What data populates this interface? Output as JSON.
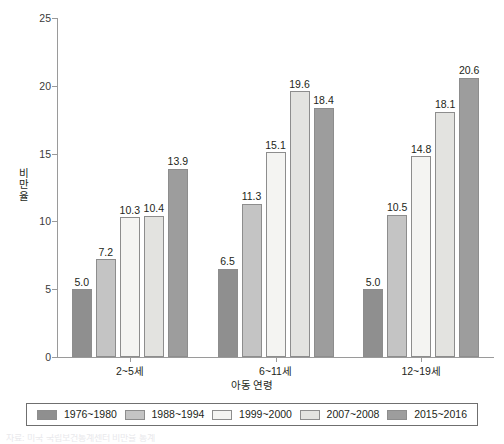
{
  "chart_data": {
    "type": "bar",
    "title": "",
    "subtitle": "",
    "xlabel": "아동 연령",
    "ylabel": "비만율",
    "categories": [
      "2~5세",
      "6~11세",
      "12~19세"
    ],
    "series": [
      {
        "name": "1976~1980",
        "color": "#8f8f8f",
        "values": [
          5.0,
          6.5,
          5.0
        ]
      },
      {
        "name": "1988~1994",
        "color": "#c4c4c4",
        "values": [
          7.2,
          11.3,
          10.5
        ]
      },
      {
        "name": "1999~2000",
        "color": "#f4f4f2",
        "values": [
          10.3,
          15.1,
          14.8
        ]
      },
      {
        "name": "2007~2008",
        "color": "#e3e3e0",
        "values": [
          10.4,
          19.6,
          18.1
        ]
      },
      {
        "name": "2015~2016",
        "color": "#9d9d9d",
        "values": [
          13.9,
          18.4,
          20.6
        ]
      }
    ],
    "value_labels": [
      [
        "5.0",
        "7.2",
        "10.3",
        "10.4",
        "13.9"
      ],
      [
        "6.5",
        "11.3",
        "15.1",
        "19.6",
        "18.4"
      ],
      [
        "5.0",
        "10.5",
        "14.8",
        "18.1",
        "20.6"
      ]
    ],
    "yticks": [
      0,
      5,
      10,
      15,
      20,
      25
    ],
    "ytick_labels": [
      "0",
      "5",
      "10",
      "15",
      "20",
      "25"
    ],
    "ylim": [
      0,
      25
    ],
    "grid": false,
    "legend_position": "bottom",
    "legend_entries": [
      "1976~1980",
      "1988~1994",
      "1999~2000",
      "2007~2008",
      "2015~2016"
    ]
  },
  "axis": {
    "y_title_chars": [
      "비",
      "만",
      "율"
    ],
    "y_title": "비만율",
    "x_title": "아동 연령"
  },
  "colors": {
    "axis_line": "#9a9a9a",
    "bar_border": "#8d8d8d",
    "legend_border": "#6f6f6f",
    "text": "#231f20"
  },
  "source_note": {
    "text": "자료: 미국 국립보건통계센터 비만율 통계"
  }
}
